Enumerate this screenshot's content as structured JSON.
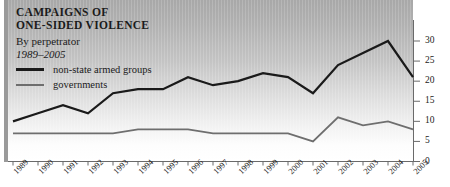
{
  "chart_data": {
    "type": "line",
    "title": "CAMPAIGNS OF ONE-SIDED VIOLENCE",
    "title_lines": [
      "CAMPAIGNS OF",
      "ONE-SIDED VIOLENCE"
    ],
    "subtitle": "By perpetrator",
    "period": "1989–2005",
    "xlabel": "",
    "ylabel": "",
    "ylim": [
      0,
      30
    ],
    "yticks": [
      0,
      5,
      10,
      15,
      20,
      25,
      30
    ],
    "ytick_labels": [
      "0",
      "5",
      "10",
      "15",
      "20",
      "25",
      "30"
    ],
    "y_axis_position": "right",
    "grid": false,
    "legend_position": "top-left",
    "categories": [
      1989,
      1990,
      1991,
      1992,
      1993,
      1994,
      1995,
      1996,
      1997,
      1998,
      1999,
      2000,
      2001,
      2002,
      2003,
      2004,
      2005
    ],
    "xtick_labels": [
      "1989",
      "1990",
      "1991",
      "1992",
      "1993",
      "1994",
      "1995",
      "1996",
      "1997",
      "1998",
      "1999",
      "2000",
      "2001",
      "2002",
      "2003",
      "2004",
      "2005"
    ],
    "series": [
      {
        "name": "non-state armed groups",
        "color": "#1a1a1a",
        "line_width": 2.2,
        "values": [
          10,
          12,
          14,
          12,
          17,
          18,
          18,
          21,
          19,
          20,
          22,
          21,
          17,
          24,
          27,
          30,
          21
        ]
      },
      {
        "name": "governments",
        "color": "#6e6e6e",
        "line_width": 1.8,
        "values": [
          7,
          7,
          7,
          7,
          7,
          8,
          8,
          8,
          7,
          7,
          7,
          7,
          5,
          11,
          9,
          10,
          8
        ]
      }
    ]
  },
  "legend": {
    "items": [
      {
        "label": "non-state armed groups"
      },
      {
        "label": "governments"
      }
    ]
  },
  "colors": {
    "nonstate": "#1a1a1a",
    "governments": "#6e6e6e",
    "axis": "#6a6a6a",
    "text": "#1b1b1b"
  }
}
